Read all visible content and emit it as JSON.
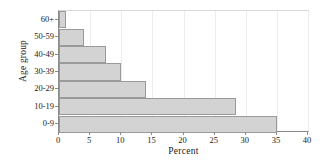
{
  "chart_data": {
    "type": "bar",
    "orientation": "horizontal",
    "title": "",
    "xlabel": "Percent",
    "ylabel": "Age group",
    "categories": [
      "0-9",
      "10-19",
      "20-29",
      "30-39",
      "40-49",
      "50-59",
      "60+"
    ],
    "values": [
      35,
      28.5,
      14,
      10,
      7.5,
      4,
      1.2
    ],
    "xlim": [
      0,
      40
    ],
    "xticks": [
      0,
      5,
      10,
      15,
      20,
      25,
      30,
      35,
      40
    ],
    "xtick_labels": [
      "0",
      "5",
      "10",
      "15",
      "20",
      "25",
      "30",
      "35",
      "40"
    ],
    "grid": true,
    "legend": null,
    "bar_color": "#d3d3d3",
    "bar_edge_color": "#9a9a9a",
    "background": "#ffffff"
  }
}
